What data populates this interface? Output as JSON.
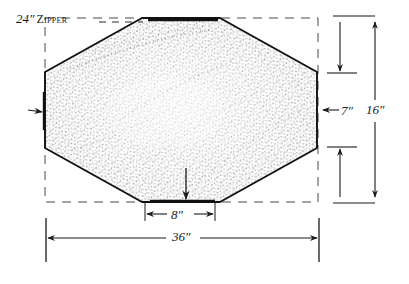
{
  "diagram": {
    "kind": "sewing-pattern-technical-drawing",
    "background_color": "#ffffff",
    "ink_color": "#1a1a1a",
    "fabric_texture": "stippled-fabric-fill"
  },
  "labels": {
    "zipper_size": "24″",
    "zipper_word": "Zipper",
    "corner_depth": "7″",
    "total_height": "16″",
    "bottom_flat_width": "8″",
    "total_width": "36″"
  },
  "shape": {
    "name": "octagon-cushion-outline",
    "points": "142,18 220,18 317,72 317,148 220,202 142,202 45,148 45,72",
    "bounding_box": {
      "left": 45,
      "top": 18,
      "right": 318,
      "bottom": 202
    }
  },
  "annotations": {
    "zipper_leader": "dashed leader line from 24-inch zipper label to top edge",
    "left_edge_arrow": "arrow pointing right at left vertical edge",
    "bottom_center_arrow": "arrow pointing down at bottom flat edge",
    "right_arrow_7in": "arrow pointing left toward right vertical edge"
  }
}
